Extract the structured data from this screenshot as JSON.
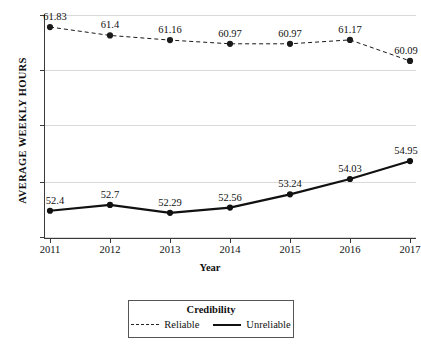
{
  "chart_data": {
    "type": "line",
    "title": "",
    "xlabel": "Year",
    "ylabel": "AVERAGE WEEKLY HOURS",
    "x": [
      "2011",
      "2012",
      "2013",
      "2014",
      "2015",
      "2016",
      "2017"
    ],
    "categories": [
      "2011",
      "2012",
      "2013",
      "2014",
      "2015",
      "2016",
      "2017"
    ],
    "ylim": [
      51.0,
      62.5
    ],
    "y_gridlines": [
      60,
      58,
      56,
      54,
      52
    ],
    "y_tick_labels_visible": false,
    "grid": true,
    "legend_position": "bottom-center",
    "legend_title": "Credibility",
    "series": [
      {
        "name": "Reliable",
        "style": "dashed",
        "marker": "circle",
        "color": "#1a1a1a",
        "values": [
          61.83,
          61.4,
          61.16,
          60.97,
          60.97,
          61.17,
          60.09
        ],
        "labels": [
          "61.83",
          "61.4",
          "61.16",
          "60.97",
          "60.97",
          "61.17",
          "60.09"
        ]
      },
      {
        "name": "Unreliable",
        "style": "solid",
        "marker": "circle",
        "color": "#111111",
        "values": [
          52.4,
          52.7,
          52.29,
          52.56,
          53.24,
          54.03,
          54.95
        ],
        "labels": [
          "52.4",
          "52.7",
          "52.29",
          "52.56",
          "53.24",
          "54.03",
          "54.95"
        ]
      }
    ]
  },
  "axes": {
    "y_title": "AVERAGE WEEKLY HOURS",
    "x_title": "Year",
    "x_tick_labels": [
      "2011",
      "2012",
      "2013",
      "2014",
      "2015",
      "2016",
      "2017"
    ]
  },
  "legend": {
    "title": "Credibility",
    "entries": [
      {
        "label": "Reliable",
        "style": "dashed"
      },
      {
        "label": "Unreliable",
        "style": "solid"
      }
    ]
  },
  "colors": {
    "background": "#ffffff",
    "grid": "#d9d9d9",
    "axis": "#3a3a3a",
    "line": "#111111",
    "text": "#111111",
    "legend_border": "#555555"
  }
}
